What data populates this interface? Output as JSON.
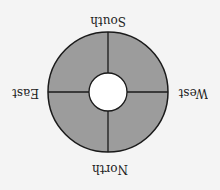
{
  "diagram": {
    "type": "compass-ring",
    "orientation": "rotated-180",
    "labels": {
      "north": "North",
      "south": "South",
      "east": "East",
      "west": "West"
    },
    "colors": {
      "ring_fill": "#9c9c9c",
      "stroke": "#1a1a1a",
      "hole_fill": "#ffffff",
      "background": "#f4f4f4"
    },
    "ring": {
      "outer_radius": 60,
      "inner_radius": 19,
      "segments": 4
    }
  }
}
